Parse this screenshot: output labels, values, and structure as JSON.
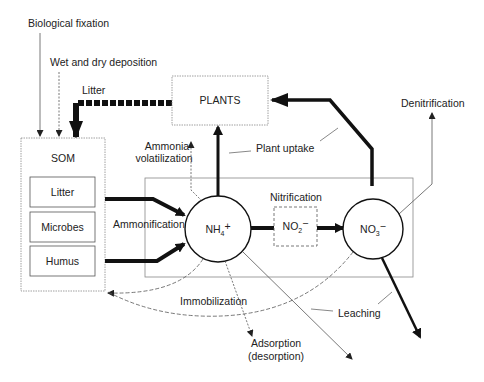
{
  "diagram": {
    "type": "nitrogen-cycle",
    "nodes": {
      "plants": "PLANTS",
      "som": "SOM",
      "som_litter": "Litter",
      "som_microbes": "Microbes",
      "som_humus": "Humus",
      "nh4": {
        "base": "NH",
        "sub": "4",
        "sup": "+"
      },
      "no2": {
        "base": "NO",
        "sub": "2",
        "sup": "−"
      },
      "no3": {
        "base": "NO",
        "sub": "3",
        "sup": "−"
      }
    },
    "labels": {
      "biological_fixation": "Biological fixation",
      "wet_dry_deposition": "Wet and dry deposition",
      "litter": "Litter",
      "denitrification": "Denitrification",
      "ammonia_volatilization_1": "Ammonia",
      "ammonia_volatilization_2": "volatilization",
      "plant_uptake": "Plant uptake",
      "nitrification": "Nitrification",
      "ammonification": "Ammonification",
      "immobilization": "Immobilization",
      "leaching": "Leaching",
      "adsorption_1": "Adsorption",
      "adsorption_2": "(desorption)"
    },
    "colors": {
      "ink": "#111111",
      "thin_line": "#555555",
      "box_border": "#888888"
    }
  }
}
